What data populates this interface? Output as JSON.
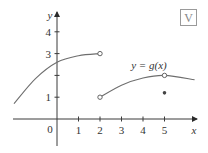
{
  "chart_data": {
    "type": "line",
    "title": "",
    "xlabel": "x",
    "ylabel": "y",
    "xlim": [
      -2,
      6.5
    ],
    "ylim": [
      -1.2,
      4.8
    ],
    "x_ticks": [
      1,
      2,
      3,
      4,
      5
    ],
    "y_ticks": [
      1,
      3,
      4
    ],
    "origin_label": "0",
    "curve_label": "y = g(x)",
    "grid": false,
    "series": [
      {
        "name": "g left piece",
        "points": [
          [
            -2,
            0.7
          ],
          [
            -1,
            1.85
          ],
          [
            0,
            2.6
          ],
          [
            1,
            2.9
          ],
          [
            2,
            3.0
          ]
        ],
        "end_open": true
      },
      {
        "name": "g right piece",
        "points": [
          [
            2,
            1.0
          ],
          [
            3,
            1.55
          ],
          [
            4,
            1.88
          ],
          [
            5,
            2.0
          ],
          [
            6.4,
            1.8
          ]
        ],
        "start_open": true
      }
    ],
    "open_points": [
      [
        2,
        3
      ],
      [
        2,
        1
      ],
      [
        5,
        2
      ]
    ],
    "filled_points": [
      [
        5,
        1.2
      ]
    ]
  },
  "badge": {
    "glyph": "V",
    "icon": "graph-badge-icon"
  }
}
